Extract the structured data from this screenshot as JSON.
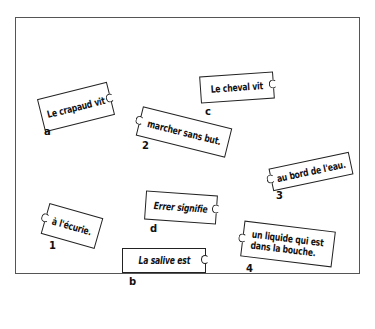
{
  "exercise": {
    "type": "matching puzzle pieces",
    "sentence_starts": [
      {
        "id": "a",
        "text": "Le crapaud vit"
      },
      {
        "id": "b",
        "text": "La salive est"
      },
      {
        "id": "c",
        "text": "Le cheval vit"
      },
      {
        "id": "d",
        "text": "Errer signifie"
      }
    ],
    "sentence_ends": [
      {
        "id": "1",
        "text": "à l'écurie."
      },
      {
        "id": "2",
        "text": "marcher sans but."
      },
      {
        "id": "3",
        "text": "au bord de l'eau."
      },
      {
        "id": "4",
        "line1": "un liquide qui est",
        "line2": "dans la bouche."
      }
    ]
  }
}
